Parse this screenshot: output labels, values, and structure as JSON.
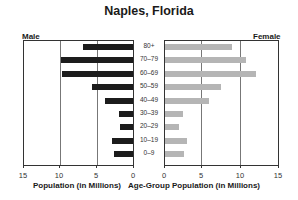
{
  "chart_data": {
    "type": "bar",
    "orientation": "horizontal",
    "subtype": "population-pyramid",
    "title": "Naples, Florida",
    "categories": [
      "80+",
      "70–79",
      "60–69",
      "50–59",
      "40–49",
      "30–39",
      "20–29",
      "10–19",
      "0–9"
    ],
    "series": [
      {
        "name": "Male",
        "color": "#1c1c1c",
        "values": [
          7.0,
          10.0,
          9.8,
          5.7,
          4.0,
          2.1,
          1.9,
          3.0,
          2.7
        ]
      },
      {
        "name": "Female",
        "color": "#b5b5b5",
        "values": [
          9.0,
          10.8,
          12.1,
          7.5,
          5.9,
          2.5,
          2.0,
          3.0,
          2.6
        ]
      }
    ],
    "xlabel_left": "Population (in Millions)",
    "xlabel_center": "Age-Group",
    "xlabel_right": "Population (in Millions)",
    "xlim": [
      0,
      15
    ],
    "ticks_left": [
      "15",
      "10",
      "5",
      "0"
    ],
    "ticks_right": [
      "0",
      "5",
      "10",
      "15"
    ],
    "grid": true,
    "legend": {
      "left": "Male",
      "right": "Female",
      "position": "top"
    }
  },
  "labels": {
    "title": "Naples, Florida",
    "male": "Male",
    "female": "Female",
    "xlabel_left": "Population (in Millions)",
    "xlabel_center": "Age-Group",
    "xlabel_right": "Population (in Millions)"
  }
}
